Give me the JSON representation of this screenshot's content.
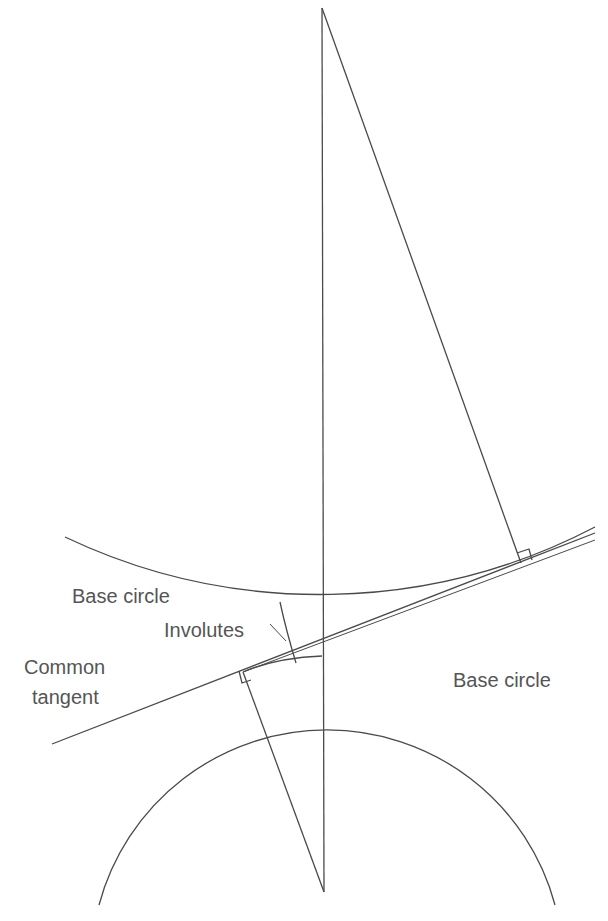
{
  "diagram": {
    "type": "involute gear tooth geometry",
    "labels": {
      "upper_base_circle": "Base circle",
      "involutes": "Involutes",
      "common_tangent_line1": "Common",
      "common_tangent_line2": "tangent",
      "lower_base_circle": "Base circle"
    },
    "colors": {
      "line": "#4a4a4a",
      "text": "#555555",
      "background": "#ffffff"
    }
  }
}
